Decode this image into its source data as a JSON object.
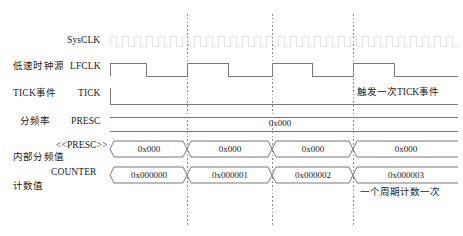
{
  "diagram": {
    "background": "#ffffff",
    "line_color": "#6e6e6e",
    "text_color": "#1a1a1a",
    "faint_color": "#dcdcdc",
    "marker_color": "#8a8a8a"
  },
  "rows": [
    {
      "id": "sysclk",
      "cn_label": "",
      "en_label": "SysCLK",
      "type": "fast-clock",
      "note": "high frequency clock, rendered very faint"
    },
    {
      "id": "lfclk",
      "cn_label": "低速时钟源",
      "en_label": "LFCLK",
      "type": "clock",
      "pulses": 4
    },
    {
      "id": "tick",
      "cn_label": "TICK事件",
      "en_label": "TICK",
      "type": "level-low"
    },
    {
      "id": "presc",
      "cn_label": "分频率",
      "en_label": "PRESC",
      "type": "bus-static",
      "value": "0x000"
    },
    {
      "id": "presc-internal",
      "cn_label": "内部分频值",
      "en_label": "<<PRESC>>",
      "type": "bus",
      "values": [
        "0x000",
        "0x000",
        "0x000",
        "0x000"
      ]
    },
    {
      "id": "counter",
      "cn_label": "计数值",
      "en_label": "COUNTER",
      "type": "bus",
      "values": [
        "0x000000",
        "0x000001",
        "0x000002",
        "0x000003"
      ]
    }
  ],
  "annotations": [
    {
      "id": "tick-event",
      "text": "触发一次TICK事件"
    },
    {
      "id": "counter-period",
      "text": "一个周期计数一次"
    }
  ]
}
